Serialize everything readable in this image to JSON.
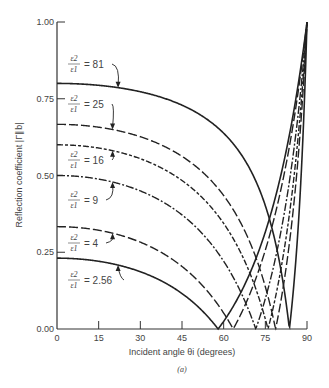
{
  "chart_data": {
    "type": "line",
    "title": "",
    "caption": "(a)",
    "xlabel": "Incident angle θi (degrees)",
    "ylabel": "Reflection coefficient |Γ∥b|",
    "xlim": [
      0,
      90
    ],
    "ylim": [
      0,
      1
    ],
    "xticks": [
      0,
      15,
      30,
      45,
      60,
      75,
      90
    ],
    "xtick_labels": [
      "0",
      "15",
      "30",
      "45",
      "60",
      "75",
      "90"
    ],
    "yticks": [
      0,
      0.25,
      0.5,
      0.75,
      1.0
    ],
    "ytick_labels": [
      "0.00",
      "0.25",
      "0.50",
      "0.75",
      "1.00"
    ],
    "grid": false,
    "legend": "inline annotations with arrows",
    "series": [
      {
        "name": "ε2/ε1 = 81",
        "ratio_label": "81",
        "style": "solid",
        "brewster_deg": 83.66,
        "x": [
          0,
          15,
          30,
          45,
          60,
          70,
          75,
          80,
          83.66,
          85,
          88,
          90
        ],
        "y": [
          0.8,
          0.795,
          0.773,
          0.729,
          0.638,
          0.512,
          0.402,
          0.223,
          0.0,
          0.118,
          0.52,
          1.0
        ]
      },
      {
        "name": "ε2/ε1 = 25",
        "ratio_label": "25",
        "style": "longdash",
        "brewster_deg": 78.69,
        "x": [
          0,
          15,
          30,
          45,
          60,
          70,
          75,
          78.69,
          80,
          85,
          88,
          90
        ],
        "y": [
          0.667,
          0.657,
          0.626,
          0.562,
          0.435,
          0.27,
          0.137,
          0.0,
          0.061,
          0.384,
          0.698,
          1.0
        ]
      },
      {
        "name": "ε2/ε1 = 16",
        "ratio_label": "16",
        "style": "dashdot2",
        "brewster_deg": 75.96,
        "x": [
          0,
          15,
          30,
          45,
          60,
          70,
          75.96,
          80,
          85,
          90
        ],
        "y": [
          0.6,
          0.589,
          0.555,
          0.484,
          0.344,
          0.169,
          0.0,
          0.166,
          0.471,
          1.0
        ]
      },
      {
        "name": "ε2/ε1 = 9",
        "ratio_label": "9",
        "style": "dashdot",
        "brewster_deg": 71.57,
        "x": [
          0,
          15,
          30,
          45,
          60,
          65,
          71.57,
          75,
          80,
          85,
          90
        ],
        "y": [
          0.5,
          0.488,
          0.45,
          0.372,
          0.221,
          0.142,
          0.0,
          0.1,
          0.29,
          0.567,
          1.0
        ]
      },
      {
        "name": "ε2/ε1 = 4",
        "ratio_label": "4",
        "style": "longdash",
        "brewster_deg": 63.43,
        "x": [
          0,
          15,
          30,
          45,
          55,
          63.43,
          70,
          75,
          80,
          85,
          90
        ],
        "y": [
          0.333,
          0.322,
          0.283,
          0.204,
          0.113,
          0.0,
          0.136,
          0.268,
          0.44,
          0.673,
          1.0
        ]
      },
      {
        "name": "ε2/ε1 = 2.56",
        "ratio_label": "2.56",
        "style": "solid",
        "brewster_deg": 57.99,
        "x": [
          0,
          15,
          30,
          45,
          50,
          57.99,
          65,
          70,
          75,
          80,
          85,
          90
        ],
        "y": [
          0.231,
          0.221,
          0.187,
          0.116,
          0.077,
          0.0,
          0.112,
          0.212,
          0.338,
          0.5,
          0.713,
          1.0
        ]
      }
    ],
    "annotations": [
      {
        "series": "81",
        "label_x": 70,
        "label_y": 64,
        "arrow_to_deg": 22
      },
      {
        "series": "25",
        "label_x": 70,
        "label_y": 104,
        "arrow_to_deg": 20
      },
      {
        "series": "16",
        "label_x": 70,
        "label_y": 160,
        "arrow_to_deg": 20
      },
      {
        "series": "9",
        "label_x": 70,
        "label_y": 200,
        "arrow_to_deg": 20
      },
      {
        "series": "4",
        "label_x": 70,
        "label_y": 243,
        "arrow_to_deg": 20
      },
      {
        "series": "2.56",
        "label_x": 70,
        "label_y": 280,
        "arrow_to_deg": 22
      }
    ]
  },
  "labels": {
    "frac_num": "ε2",
    "frac_den": "ε1",
    "equals": "="
  }
}
